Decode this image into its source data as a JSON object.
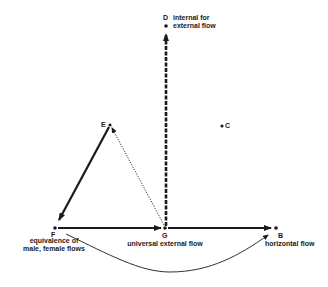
{
  "diagram": {
    "points": {
      "D": {
        "letter": "D",
        "label_line1": "internal for",
        "label_line2": "external flow"
      },
      "E": {
        "letter": "E"
      },
      "C": {
        "letter": "C"
      },
      "F": {
        "letter": "F",
        "label_line1": "equivalence of",
        "label_line2": "male, female flows"
      },
      "G": {
        "letter": "G",
        "label": "universal external flow"
      },
      "B": {
        "letter": "B",
        "label": "horizontal flow"
      }
    },
    "edges": [
      {
        "from": "G",
        "to": "D",
        "style": "dashed-bold-arrow"
      },
      {
        "from": "E",
        "to": "F",
        "style": "solid-bold-arrow"
      },
      {
        "from": "G",
        "to": "E",
        "style": "dotted-arrow"
      },
      {
        "from": "F",
        "to": "G",
        "style": "solid-bold-arrow"
      },
      {
        "from": "G",
        "to": "B",
        "style": "solid-bold-arrow"
      },
      {
        "from": "F",
        "to": "B",
        "style": "thin-curved-arrow"
      }
    ],
    "colors": {
      "ink": "#1a1a1a",
      "background": "#ffffff"
    }
  }
}
